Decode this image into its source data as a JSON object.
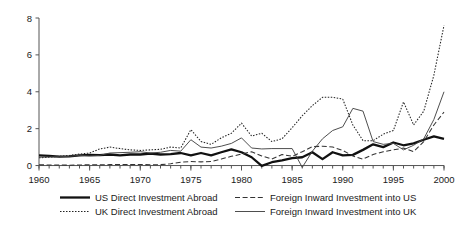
{
  "chart_data": {
    "type": "line",
    "title": "",
    "subtitle": "",
    "xlabel": "",
    "ylabel": "",
    "xlim": [
      1960,
      2000
    ],
    "ylim": [
      -0.35,
      8
    ],
    "grid": false,
    "legend_position": "bottom",
    "y_ticks": [
      0,
      2,
      4,
      6,
      8
    ],
    "y_tick_labels": [
      "0",
      "2",
      "4",
      "6",
      "8"
    ],
    "x_ticks": [
      1960,
      1965,
      1970,
      1975,
      1980,
      1985,
      1990,
      1995,
      2000
    ],
    "x_tick_labels": [
      "1960",
      "1965",
      "1970",
      "1975",
      "1980",
      "1985",
      "1990",
      "1995",
      "2000"
    ],
    "x_minor_tick_step": 1,
    "x": [
      1960,
      1961,
      1962,
      1963,
      1964,
      1965,
      1966,
      1967,
      1968,
      1969,
      1970,
      1971,
      1972,
      1973,
      1974,
      1975,
      1976,
      1977,
      1978,
      1979,
      1980,
      1981,
      1982,
      1983,
      1984,
      1985,
      1986,
      1987,
      1988,
      1989,
      1990,
      1991,
      1992,
      1993,
      1994,
      1995,
      1996,
      1997,
      1998,
      1999,
      2000
    ],
    "series": [
      {
        "name": "US Direct Investment Abroad",
        "style": "thick-solid",
        "color": "#111111",
        "values": [
          0.55,
          0.52,
          0.48,
          0.5,
          0.55,
          0.58,
          0.57,
          0.6,
          0.55,
          0.6,
          0.6,
          0.65,
          0.6,
          0.62,
          0.68,
          0.55,
          0.68,
          0.55,
          0.72,
          0.88,
          0.72,
          0.45,
          -0.02,
          0.18,
          0.28,
          0.4,
          0.45,
          0.72,
          0.35,
          0.72,
          0.55,
          0.58,
          0.85,
          1.15,
          1.0,
          1.25,
          1.1,
          1.2,
          1.4,
          1.58,
          1.45
        ]
      },
      {
        "name": "Foreign Inward Investment into US",
        "style": "dashed",
        "color": "#333333",
        "values": [
          0.04,
          0.03,
          0.03,
          0.02,
          0.03,
          0.04,
          0.04,
          0.05,
          0.06,
          0.05,
          0.06,
          0.04,
          0.05,
          0.1,
          0.18,
          0.22,
          0.2,
          0.22,
          0.35,
          0.5,
          0.62,
          0.75,
          0.52,
          0.35,
          0.6,
          0.5,
          0.75,
          1.02,
          1.05,
          1.0,
          0.82,
          0.52,
          0.35,
          0.6,
          0.75,
          0.85,
          0.95,
          0.75,
          1.3,
          2.2,
          2.9
        ]
      },
      {
        "name": "UK Direct Investment Abroad",
        "style": "dotted",
        "color": "#222222",
        "values": [
          0.42,
          0.45,
          0.5,
          0.55,
          0.62,
          0.68,
          0.9,
          1.0,
          0.92,
          0.85,
          0.82,
          0.85,
          0.88,
          1.0,
          0.95,
          1.95,
          1.3,
          1.15,
          1.5,
          1.75,
          2.3,
          1.6,
          1.75,
          1.3,
          1.45,
          2.05,
          2.7,
          3.25,
          3.7,
          3.7,
          3.6,
          2.2,
          1.35,
          1.35,
          1.7,
          1.9,
          3.45,
          2.2,
          2.95,
          4.9,
          7.6
        ]
      },
      {
        "name": "Foreign Inward Investment into UK",
        "style": "thin-solid",
        "color": "#444444",
        "values": [
          0.45,
          0.46,
          0.48,
          0.5,
          0.55,
          0.52,
          0.55,
          0.68,
          0.7,
          0.72,
          0.75,
          0.68,
          0.72,
          0.82,
          0.78,
          1.4,
          1.0,
          0.95,
          1.05,
          1.2,
          1.5,
          0.95,
          0.9,
          0.92,
          0.92,
          0.92,
          -0.1,
          0.78,
          1.45,
          1.9,
          2.1,
          3.1,
          2.95,
          1.3,
          1.15,
          1.2,
          0.85,
          1.1,
          1.45,
          2.5,
          4.0
        ]
      }
    ]
  },
  "legend": {
    "entries": [
      {
        "label": "US Direct Investment Abroad",
        "style": "thick-solid"
      },
      {
        "label": "Foreign Inward Investment into US",
        "style": "dashed"
      },
      {
        "label": "UK Direct Investment Abroad",
        "style": "dotted"
      },
      {
        "label": "Foreign Inward Investment into UK",
        "style": "thin-solid"
      }
    ]
  }
}
